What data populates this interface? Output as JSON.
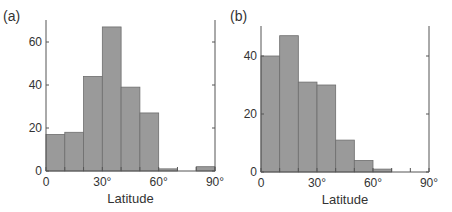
{
  "colors": {
    "bar_fill": "#9a9a9a",
    "bar_stroke": "#6e6e6e",
    "axis": "#555555",
    "text": "#333333"
  },
  "chart_data": [
    {
      "panel_label": "(a)",
      "type": "bar",
      "title": "",
      "xlabel": "Latitude",
      "ylabel": "",
      "bin_edges": [
        0,
        10,
        20,
        30,
        40,
        50,
        60,
        70,
        80,
        90
      ],
      "categories": [
        "0-10°",
        "10-20°",
        "20-30°",
        "30-40°",
        "40-50°",
        "50-60°",
        "60-70°",
        "70-80°",
        "80-90°"
      ],
      "values": [
        17,
        18,
        44,
        67,
        39,
        27,
        1,
        0,
        2
      ],
      "x_ticks": [
        "0",
        "30°",
        "60°",
        "90°"
      ],
      "y_ticks": [
        "0",
        "20",
        "40",
        "60"
      ],
      "xlim": [
        0,
        90
      ],
      "ylim": [
        0,
        70
      ],
      "grid": false,
      "legend": null
    },
    {
      "panel_label": "(b)",
      "type": "bar",
      "title": "",
      "xlabel": "Latitude",
      "ylabel": "",
      "bin_edges": [
        0,
        10,
        20,
        30,
        40,
        50,
        60,
        70,
        80,
        90
      ],
      "categories": [
        "0-10°",
        "10-20°",
        "20-30°",
        "30-40°",
        "40-50°",
        "50-60°",
        "60-70°",
        "70-80°",
        "80-90°"
      ],
      "values": [
        40,
        47,
        31,
        30,
        11,
        4,
        1,
        0,
        0
      ],
      "x_ticks": [
        "0",
        "30°",
        "60°",
        "90°"
      ],
      "y_ticks": [
        "0",
        "20",
        "40"
      ],
      "xlim": [
        0,
        90
      ],
      "ylim": [
        0,
        50
      ],
      "grid": false,
      "legend": null
    }
  ]
}
